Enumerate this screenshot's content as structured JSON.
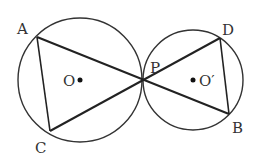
{
  "diagram": {
    "circles": [
      {
        "name": "O",
        "cx": 80,
        "cy": 80,
        "r": 62
      },
      {
        "name": "O'",
        "cx": 193,
        "cy": 80,
        "r": 50
      }
    ],
    "points": {
      "A": {
        "x": 37,
        "y": 37,
        "label": "A"
      },
      "C": {
        "x": 50,
        "y": 131,
        "label": "C"
      },
      "P": {
        "x": 143,
        "y": 80,
        "label": "P"
      },
      "D": {
        "x": 220,
        "y": 38,
        "label": "D"
      },
      "B": {
        "x": 229,
        "y": 114,
        "label": "B"
      }
    },
    "centers": {
      "O": {
        "label": "O"
      },
      "O2": {
        "label": "O′"
      }
    },
    "segments": [
      "AC",
      "AB",
      "CD",
      "DB"
    ]
  }
}
